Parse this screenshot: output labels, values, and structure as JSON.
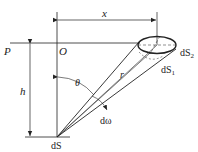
{
  "diagram": {
    "labels": {
      "x": "x",
      "P": "P",
      "O": "O",
      "h": "h",
      "theta": "θ",
      "r": "r",
      "d_omega": "dω",
      "dS": "dS",
      "dS1": "dS",
      "dS1_sub": "1",
      "dS2": "dS",
      "dS2_sub": "2"
    },
    "colors": {
      "stroke": "#222222",
      "background": "#ffffff"
    }
  }
}
